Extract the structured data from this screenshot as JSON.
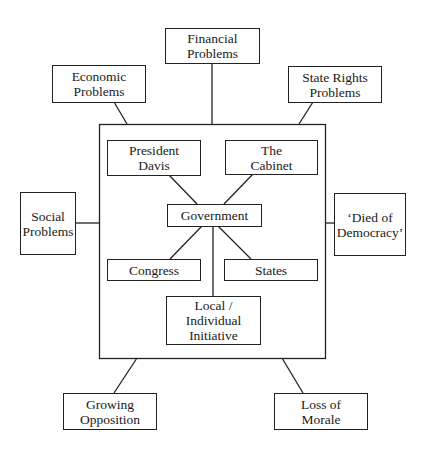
{
  "diagram": {
    "type": "concept-map",
    "frame_label": "",
    "nodes": {
      "financial": {
        "label": "Financial\nProblems"
      },
      "economic": {
        "label": "Economic\nProblems"
      },
      "state_rights": {
        "label": "State Rights\nProblems"
      },
      "social": {
        "label": "Social\nProblems"
      },
      "died_of_democracy": {
        "label": "‘Died of\nDemocracy’"
      },
      "growing_opposition": {
        "label": "Growing\nOpposition"
      },
      "loss_of_morale": {
        "label": "Loss of\nMorale"
      },
      "president_davis": {
        "label": "President\nDavis"
      },
      "the_cabinet": {
        "label": "The\nCabinet"
      },
      "government": {
        "label": "Government"
      },
      "congress": {
        "label": "Congress"
      },
      "states": {
        "label": "States"
      },
      "local_initiative": {
        "label": "Local /\nIndividual\nInitiative"
      }
    },
    "edges": [
      [
        "financial",
        "frame"
      ],
      [
        "economic",
        "frame"
      ],
      [
        "state_rights",
        "frame"
      ],
      [
        "social",
        "frame"
      ],
      [
        "died_of_democracy",
        "frame"
      ],
      [
        "growing_opposition",
        "frame"
      ],
      [
        "loss_of_morale",
        "frame"
      ],
      [
        "president_davis",
        "government"
      ],
      [
        "the_cabinet",
        "government"
      ],
      [
        "government",
        "congress"
      ],
      [
        "government",
        "states"
      ],
      [
        "government",
        "local_initiative"
      ]
    ]
  }
}
